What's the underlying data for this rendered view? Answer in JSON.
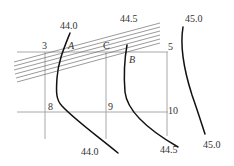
{
  "diagram": {
    "type": "contour site plan",
    "colors": {
      "grid": "#a8a8a8",
      "hatch": "#6e6e6e",
      "contour": "#111111",
      "text": "#333333"
    },
    "grid_points": [
      {
        "id": "3",
        "label": "3"
      },
      {
        "id": "C",
        "label": "C"
      },
      {
        "id": "5",
        "label": "5"
      },
      {
        "id": "8",
        "label": "8"
      },
      {
        "id": "9",
        "label": "9"
      },
      {
        "id": "10",
        "label": "10"
      }
    ],
    "point_labels": [
      {
        "id": "A",
        "label": "A"
      },
      {
        "id": "B",
        "label": "B"
      }
    ],
    "contours": [
      {
        "name": "44.0",
        "top_label": "44.0",
        "bottom_label": "44.0"
      },
      {
        "name": "44.5",
        "top_label": "44.5",
        "bottom_label": "44.5"
      },
      {
        "name": "45.0",
        "top_label": "45.0",
        "bottom_label": "45.0"
      }
    ],
    "hatch_band": {
      "line_count": 6,
      "description": "inclined band of parallel lines"
    }
  }
}
